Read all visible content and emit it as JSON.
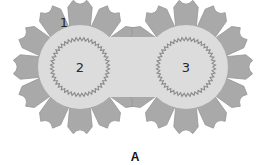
{
  "figure": {
    "panel_label": "A",
    "labels": [
      {
        "id": "1",
        "text": "1",
        "x": 64,
        "y": 22,
        "refers_to": "outer-cell"
      },
      {
        "id": "2",
        "text": "2",
        "x": 80,
        "y": 67,
        "refers_to": "left-circle"
      },
      {
        "id": "3",
        "text": "3",
        "x": 186,
        "y": 67,
        "refers_to": "right-circle"
      }
    ],
    "rosettes": [
      {
        "name": "left",
        "cx": 80,
        "cy": 67,
        "inner_r": 42,
        "outer_r": 67,
        "ring_r": 28,
        "cells": 12
      },
      {
        "name": "right",
        "cx": 186,
        "cy": 67,
        "inner_r": 42,
        "outer_r": 67,
        "ring_r": 28,
        "cells": 12
      }
    ],
    "colors": {
      "cell_fill": "#a9a9a9",
      "cell_edge": "#959595",
      "inner_fill": "#dcdcdc",
      "ring_stroke": "#8a8a8a",
      "background": "#ffffff"
    }
  }
}
